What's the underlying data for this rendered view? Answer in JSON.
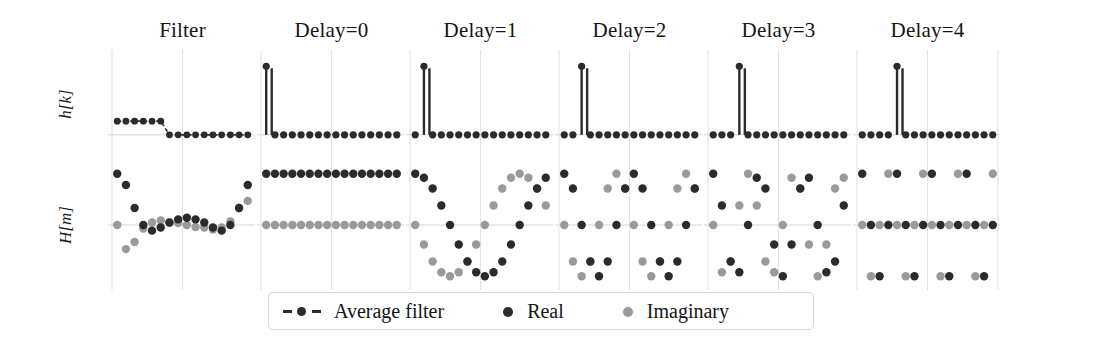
{
  "figure": {
    "width": 1096,
    "height": 360,
    "background": "#ffffff"
  },
  "colors": {
    "real": "#2b2b2b",
    "imaginary": "#9a9a9a",
    "average_filter": "#2b2b2b",
    "grid": "#e3e3e3",
    "axis": "#d5d5d5",
    "text": "#141414",
    "legend_border": "#d8d8d8"
  },
  "axes": {
    "rows": [
      {
        "id": "hk",
        "label": "h[k]"
      },
      {
        "id": "Hm",
        "label": "H[m]"
      }
    ]
  },
  "columns": [
    {
      "id": "filter",
      "title": "Filter"
    },
    {
      "id": "delay0",
      "title": "Delay=0"
    },
    {
      "id": "delay1",
      "title": "Delay=1"
    },
    {
      "id": "delay2",
      "title": "Delay=2"
    },
    {
      "id": "delay3",
      "title": "Delay=3"
    },
    {
      "id": "delay4",
      "title": "Delay=4"
    }
  ],
  "legend": {
    "items": [
      {
        "id": "average-filter",
        "label": "Average filter",
        "marker": "dash-dot",
        "color": "#2b2b2b"
      },
      {
        "id": "real",
        "label": "Real",
        "marker": "dot",
        "color": "#2b2b2b"
      },
      {
        "id": "imaginary",
        "label": "Imaginary",
        "marker": "dot",
        "color": "#9a9a9a"
      }
    ]
  },
  "chart_data": {
    "type": "scatter",
    "title": "",
    "xlabel": "",
    "ylabel": "",
    "grid": true,
    "legend_position": "bottom-center",
    "panel_rows": [
      "h[k]",
      "H[m]"
    ],
    "panel_columns": [
      "Filter",
      "Delay=0",
      "Delay=1",
      "Delay=2",
      "Delay=3",
      "Delay=4"
    ],
    "hk": {
      "ylim": [
        -0.25,
        1.15
      ],
      "xlim": [
        -0.6,
        15.6
      ],
      "k": [
        0,
        1,
        2,
        3,
        4,
        5,
        6,
        7,
        8,
        9,
        10,
        11,
        12,
        13,
        14,
        15
      ],
      "series": [
        {
          "name": "Filter",
          "marker": "average-filter",
          "values": [
            0.2,
            0.2,
            0.2,
            0.2,
            0.2,
            0.2,
            0,
            0,
            0,
            0,
            0,
            0,
            0,
            0,
            0,
            0
          ]
        },
        {
          "name": "Delay=0",
          "marker": "real",
          "values": [
            1,
            0,
            0,
            0,
            0,
            0,
            0,
            0,
            0,
            0,
            0,
            0,
            0,
            0,
            0,
            0
          ]
        },
        {
          "name": "Delay=1",
          "marker": "real",
          "values": [
            0,
            1,
            0,
            0,
            0,
            0,
            0,
            0,
            0,
            0,
            0,
            0,
            0,
            0,
            0,
            0
          ]
        },
        {
          "name": "Delay=2",
          "marker": "real",
          "values": [
            0,
            0,
            1,
            0,
            0,
            0,
            0,
            0,
            0,
            0,
            0,
            0,
            0,
            0,
            0,
            0
          ]
        },
        {
          "name": "Delay=3",
          "marker": "real",
          "values": [
            0,
            0,
            0,
            1,
            0,
            0,
            0,
            0,
            0,
            0,
            0,
            0,
            0,
            0,
            0,
            0
          ]
        },
        {
          "name": "Delay=4",
          "marker": "real",
          "values": [
            0,
            0,
            0,
            0,
            1,
            0,
            0,
            0,
            0,
            0,
            0,
            0,
            0,
            0,
            0,
            0
          ]
        }
      ]
    },
    "Hm": {
      "ylim": [
        -1.15,
        1.15
      ],
      "xlim": [
        -0.6,
        15.6
      ],
      "m": [
        0,
        1,
        2,
        3,
        4,
        5,
        6,
        7,
        8,
        9,
        10,
        11,
        12,
        13,
        14,
        15
      ],
      "panels": [
        {
          "name": "Filter",
          "real": [
            1.0,
            0.78,
            0.33,
            0.0,
            -0.11,
            -0.05,
            0.05,
            0.11,
            0.14,
            0.11,
            0.05,
            -0.05,
            -0.11,
            0.0,
            0.33,
            0.78
          ],
          "imaginary": [
            0.0,
            -0.47,
            -0.33,
            -0.07,
            0.05,
            0.09,
            0.05,
            0.04,
            0.0,
            -0.04,
            -0.05,
            -0.09,
            -0.05,
            0.07,
            0.33,
            0.47
          ]
        },
        {
          "name": "Delay=0",
          "real": [
            1,
            1,
            1,
            1,
            1,
            1,
            1,
            1,
            1,
            1,
            1,
            1,
            1,
            1,
            1,
            1
          ],
          "imaginary": [
            0,
            0,
            0,
            0,
            0,
            0,
            0,
            0,
            0,
            0,
            0,
            0,
            0,
            0,
            0,
            0
          ]
        },
        {
          "name": "Delay=1",
          "real": [
            1.0,
            0.92,
            0.71,
            0.38,
            0.0,
            -0.38,
            -0.71,
            -0.92,
            -1.0,
            -0.92,
            -0.71,
            -0.38,
            0.0,
            0.38,
            0.71,
            0.92
          ],
          "imaginary": [
            0.0,
            -0.38,
            -0.71,
            -0.92,
            -1.0,
            -0.92,
            -0.71,
            -0.38,
            0.0,
            0.38,
            0.71,
            0.92,
            1.0,
            0.92,
            0.71,
            0.38
          ]
        },
        {
          "name": "Delay=2",
          "real": [
            1.0,
            0.71,
            0.0,
            -0.71,
            -1.0,
            -0.71,
            0.0,
            0.71,
            1.0,
            0.71,
            0.0,
            -0.71,
            -1.0,
            -0.71,
            0.0,
            0.71
          ],
          "imaginary": [
            0.0,
            -0.71,
            -1.0,
            -0.71,
            0.0,
            0.71,
            1.0,
            0.71,
            0.0,
            -0.71,
            -1.0,
            -0.71,
            0.0,
            0.71,
            1.0,
            0.71
          ]
        },
        {
          "name": "Delay=3",
          "real": [
            1.0,
            0.38,
            -0.71,
            -0.92,
            0.0,
            0.92,
            0.71,
            -0.38,
            -1.0,
            -0.38,
            0.71,
            0.92,
            0.0,
            -0.92,
            -0.71,
            0.38
          ],
          "imaginary": [
            0.0,
            -0.92,
            -0.71,
            0.38,
            1.0,
            0.38,
            -0.71,
            -0.92,
            0.0,
            0.92,
            0.71,
            -0.38,
            -1.0,
            -0.38,
            0.71,
            0.92
          ]
        },
        {
          "name": "Delay=4",
          "real": [
            1.0,
            0.0,
            -1.0,
            0.0,
            1.0,
            0.0,
            -1.0,
            0.0,
            1.0,
            0.0,
            -1.0,
            0.0,
            1.0,
            0.0,
            -1.0,
            0.0
          ],
          "imaginary": [
            0.0,
            -1.0,
            0.0,
            1.0,
            0.0,
            -1.0,
            0.0,
            1.0,
            0.0,
            -1.0,
            0.0,
            1.0,
            0.0,
            -1.0,
            0.0,
            1.0
          ]
        }
      ]
    }
  }
}
